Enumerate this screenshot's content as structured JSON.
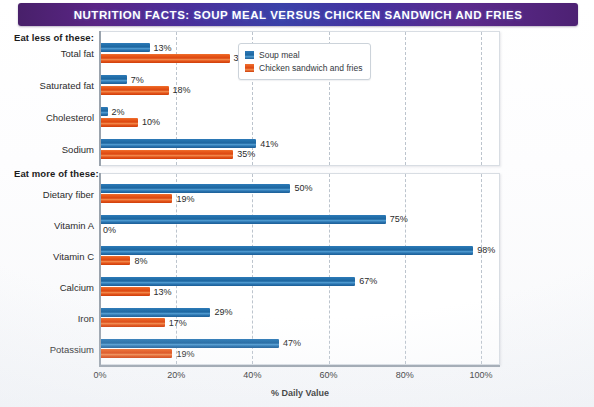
{
  "banner": {
    "title": "NUTRITION FACTS:  SOUP MEAL VERSUS CHICKEN SANDWICH AND FRIES",
    "gradient_start": "#48206a",
    "gradient_mid": "#3a41a8",
    "gradient_end": "#4d2173"
  },
  "sections": {
    "eat_less_label": "Eat less of these:",
    "eat_more_label": "Eat more of these:"
  },
  "legend": {
    "items": [
      {
        "label": "Soup meal",
        "color": "#1d66a0"
      },
      {
        "label": "Chicken sandwich and fries",
        "color": "#dc4710"
      }
    ]
  },
  "axis": {
    "title": "% Daily Value",
    "ticks": [
      "0%",
      "20%",
      "40%",
      "60%",
      "80%",
      "100%"
    ],
    "min": 0,
    "max": 105
  },
  "chart_data": [
    {
      "type": "bar",
      "orientation": "horizontal",
      "title": "Eat less of these:",
      "xlabel": "% Daily Value",
      "ylabel": "",
      "xlim": [
        0,
        105
      ],
      "grid": true,
      "legend_position": "top-right",
      "categories": [
        "Total fat",
        "Saturated fat",
        "Cholesterol",
        "Sodium"
      ],
      "series": [
        {
          "name": "Soup meal",
          "color": "#1d66a0",
          "values": [
            13,
            7,
            2,
            41
          ],
          "labels": [
            "13%",
            "7%",
            "2%",
            "41%"
          ]
        },
        {
          "name": "Chicken sandwich and fries",
          "color": "#dc4710",
          "values": [
            34,
            18,
            10,
            35
          ],
          "labels": [
            "34%",
            "18%",
            "10%",
            "35%"
          ]
        }
      ]
    },
    {
      "type": "bar",
      "orientation": "horizontal",
      "title": "Eat more of these:",
      "xlabel": "% Daily Value",
      "ylabel": "",
      "xlim": [
        0,
        105
      ],
      "grid": true,
      "legend_position": "none",
      "categories": [
        "Dietary fiber",
        "Vitamin A",
        "Vitamin C",
        "Calcium",
        "Iron",
        "Potassium"
      ],
      "series": [
        {
          "name": "Soup meal",
          "color": "#1d66a0",
          "values": [
            50,
            75,
            98,
            67,
            29,
            47
          ],
          "labels": [
            "50%",
            "75%",
            "98%",
            "67%",
            "29%",
            "47%"
          ]
        },
        {
          "name": "Chicken sandwich and fries",
          "color": "#dc4710",
          "values": [
            19,
            0,
            8,
            13,
            17,
            19
          ],
          "labels": [
            "19%",
            "0%",
            "8%",
            "13%",
            "17%",
            "19%"
          ]
        }
      ]
    }
  ]
}
